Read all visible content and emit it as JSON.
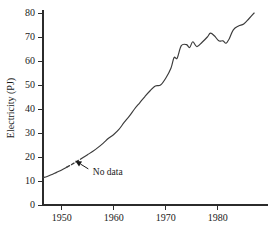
{
  "chart_data": {
    "type": "line",
    "title": "",
    "xlabel": "",
    "ylabel": "Electricity (PJ)",
    "xlim": [
      1946.4,
      1987.2
    ],
    "ylim": [
      0,
      80
    ],
    "grid": false,
    "legend": null,
    "xticks": [
      1950,
      1960,
      1970,
      1980
    ],
    "xtick_labels": [
      "1950",
      "1960",
      "1970",
      "1980"
    ],
    "yticks": [
      0,
      10,
      20,
      30,
      40,
      50,
      60,
      70,
      80
    ],
    "ytick_labels": [
      "0",
      "10",
      "20",
      "30",
      "40",
      "50",
      "60",
      "70",
      "80"
    ],
    "annotations": [
      {
        "text": "No data",
        "points_to_x": 1952.6,
        "points_to_y": 18.4,
        "label_x": 1955.6,
        "label_y": 14.0
      }
    ],
    "series": [
      {
        "name": "Electricity",
        "style": "solid",
        "segment": "observed-early",
        "x": [
          1946.4,
          1947.2,
          1948.0,
          1949.0,
          1950.0,
          1951.0
        ],
        "values": [
          11.4,
          11.9,
          12.6,
          13.6,
          14.6,
          15.8
        ]
      },
      {
        "name": "Electricity",
        "style": "dashed",
        "segment": "no-data-interpolated",
        "x": [
          1951.0,
          1952.0,
          1953.0,
          1954.2
        ],
        "values": [
          15.8,
          17.0,
          18.3,
          19.9
        ]
      },
      {
        "name": "Electricity",
        "style": "solid",
        "segment": "observed-late",
        "x": [
          1954.2,
          1955.0,
          1956.0,
          1957.0,
          1958.0,
          1959.0,
          1960.0,
          1961.0,
          1962.0,
          1963.0,
          1964.0,
          1965.0,
          1966.0,
          1967.0,
          1968.0,
          1969.0,
          1970.0,
          1971.0,
          1971.6,
          1972.2,
          1973.0,
          1974.0,
          1974.6,
          1975.2,
          1976.0,
          1977.0,
          1978.0,
          1978.6,
          1979.4,
          1980.2,
          1981.0,
          1981.6,
          1982.2,
          1983.0,
          1984.0,
          1985.0,
          1986.0,
          1987.0
        ],
        "values": [
          19.9,
          21.0,
          22.4,
          24.0,
          25.8,
          27.8,
          29.4,
          31.5,
          34.4,
          37.0,
          40.0,
          42.6,
          45.2,
          47.6,
          49.6,
          50.0,
          52.8,
          57.0,
          61.4,
          61.2,
          66.4,
          66.8,
          65.6,
          68.0,
          66.0,
          67.8,
          70.0,
          71.6,
          70.4,
          68.4,
          68.4,
          67.4,
          69.2,
          73.0,
          74.6,
          75.4,
          77.6,
          80.0
        ]
      }
    ],
    "axis_px": {
      "x_origin": 43,
      "y_zero": 205,
      "px_per_year": 5.2,
      "px_per_unit": 2.4,
      "x_right_end": 268,
      "y_top": 13
    }
  }
}
